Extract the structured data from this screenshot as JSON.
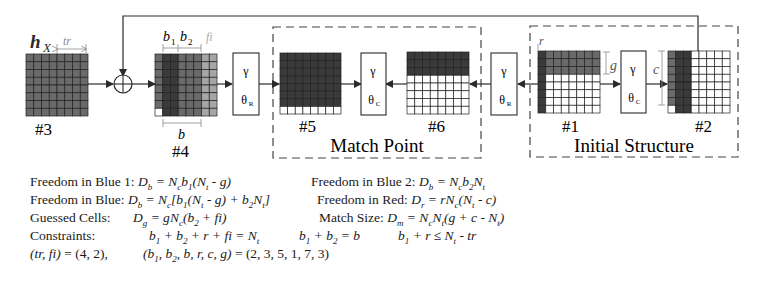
{
  "diagram": {
    "labels": {
      "hx": "h",
      "hx_sub": "X",
      "tr": "tr",
      "b1": "b",
      "b1_sub": "1",
      "b2": "b",
      "b2_sub": "2",
      "fi": "fi",
      "b": "b",
      "r": "r",
      "g": "g",
      "c": "c"
    },
    "state_names": {
      "s3": "#3",
      "s4": "#4",
      "s5": "#5",
      "s6": "#6",
      "s1": "#1",
      "s2": "#2"
    },
    "operators": {
      "gamma": "γ",
      "theta_r": "θ",
      "theta_r_sub": "R",
      "theta_c": "θ",
      "theta_c_sub": "C"
    },
    "regions": {
      "match_point": "Match Point",
      "initial_structure": "Initial Structure"
    },
    "colors": {
      "dark": "#3a3a3a",
      "mid": "#6a6a6a",
      "light": "#a5a5a5",
      "white": "#ffffff",
      "line": "#2a2a2a",
      "dim_label": "#8a8a8a"
    }
  },
  "formulas": {
    "row1_left_label": "Freedom in Blue 1: ",
    "row1_left_math": "D_b = N_c b_1(N_t - g)",
    "row1_right_label": "Freedom in Blue 2: ",
    "row1_right_math": "D_b = N_c b_2 N_t",
    "row2_left_label": "Freedom in Blue: ",
    "row2_left_math": "D_b = N_c[b_1(N_t - g) + b_2 N_t]",
    "row2_right_label": "Freedom in Red: ",
    "row2_right_math": "D_r = rN_c(N_t - c)",
    "row3_left_label": "Guessed Cells:",
    "row3_left_math": "D_g = gN_c(b_2 + fi)",
    "row3_right_label": "Match Size: ",
    "row3_right_math": "D_m = N_c N_t(g + c - N_t)",
    "row4_label": "Constraints:",
    "row4_c1": "b_1 + b_2 + r + fi = N_t",
    "row4_c2": "b_1 + b_2 = b",
    "row4_c3": "b_1 + r ≤ N_t - tr",
    "row5_a": "(tr, fi) = (4, 2),",
    "row5_b": "(b_1, b_2, b, r, c, g) = (2, 3, 5, 1, 7, 3)"
  }
}
